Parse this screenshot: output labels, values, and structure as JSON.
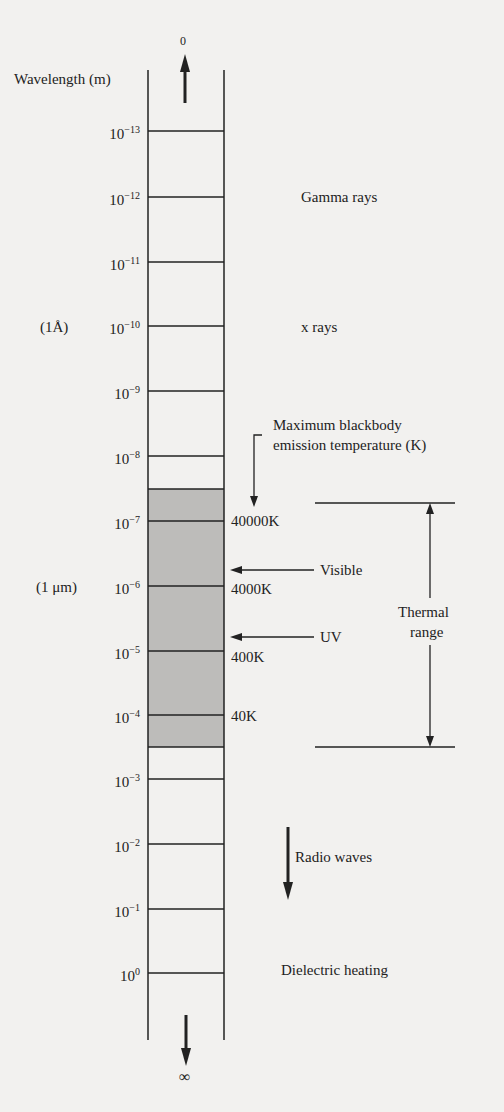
{
  "axis": {
    "title": "Wavelength (m)",
    "top_symbol": "0",
    "bottom_symbol": "∞",
    "ticks": [
      {
        "base": "10",
        "exp": "−13",
        "y": 131
      },
      {
        "base": "10",
        "exp": "−12",
        "y": 197
      },
      {
        "base": "10",
        "exp": "−11",
        "y": 262
      },
      {
        "base": "10",
        "exp": "−10",
        "y": 326
      },
      {
        "base": "10",
        "exp": "−9",
        "y": 391
      },
      {
        "base": "10",
        "exp": "−8",
        "y": 456
      },
      {
        "base": "10",
        "exp": "−7",
        "y": 521
      },
      {
        "base": "10",
        "exp": "−6",
        "y": 586
      },
      {
        "base": "10",
        "exp": "−5",
        "y": 651
      },
      {
        "base": "10",
        "exp": "−4",
        "y": 715
      },
      {
        "base": "10",
        "exp": "−3",
        "y": 779
      },
      {
        "base": "10",
        "exp": "−2",
        "y": 844
      },
      {
        "base": "10",
        "exp": "−1",
        "y": 909
      },
      {
        "base": "10",
        "exp": "0",
        "y": 973
      }
    ],
    "unit_notes": [
      {
        "label": "(1Å)",
        "tick": "10^-10"
      },
      {
        "label": "(1 μm)",
        "tick": "10^-6"
      }
    ]
  },
  "regions": {
    "gamma": "Gamma rays",
    "xray": "x rays",
    "visible": "Visible",
    "uv": "UV",
    "radio": "Radio waves",
    "dielectric": "Dielectric heating"
  },
  "blackbody": {
    "title_line1": "Maximum blackbody",
    "title_line2": "emission temperature (K)",
    "temps": [
      {
        "label": "40000K",
        "tick": "10^-7"
      },
      {
        "label": "4000K",
        "tick": "10^-6"
      },
      {
        "label": "400K",
        "tick": "10^-5"
      },
      {
        "label": "40K",
        "tick": "10^-4"
      }
    ]
  },
  "thermal": {
    "line1": "Thermal",
    "line2": "range"
  },
  "colors": {
    "background": "#f2f1ef",
    "ink": "#222222",
    "shaded": "#bdbcba"
  }
}
